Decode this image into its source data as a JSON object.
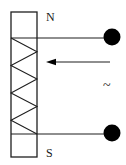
{
  "labels": {
    "north_pole": "N",
    "south_pole": "S",
    "ac_source": "~"
  },
  "colors": {
    "line": "#1f1f1f",
    "terminal": "#000000",
    "bg": "#ffffff",
    "text": "#1a1a1a"
  },
  "arrow": {
    "direction": "left"
  }
}
